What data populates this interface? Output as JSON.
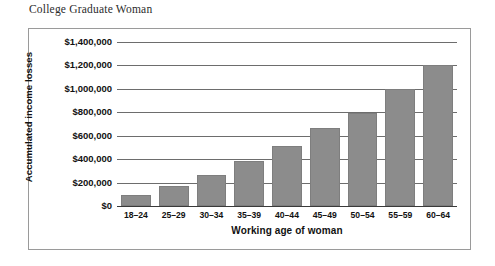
{
  "figure": {
    "caption": "College Graduate Woman"
  },
  "chart_data": {
    "type": "bar",
    "title": "College Graduate Woman",
    "xlabel": "Working age of woman",
    "ylabel": "Accumulated income losses",
    "categories": [
      "18–24",
      "25–29",
      "30–34",
      "35–39",
      "40–44",
      "45–49",
      "50–54",
      "55–59",
      "60–64"
    ],
    "values": [
      90000,
      170000,
      265000,
      385000,
      510000,
      670000,
      790000,
      1000000,
      1200000
    ],
    "ylim": [
      0,
      1400000
    ],
    "ytick_values": [
      0,
      200000,
      400000,
      600000,
      800000,
      1000000,
      1200000,
      1400000
    ],
    "ytick_labels": [
      "$0",
      "$200,000",
      "$400,000",
      "$600,000",
      "$800,000",
      "$1,000,000",
      "$1,200,000",
      "$1,400,000"
    ],
    "grid": true,
    "legend": "none",
    "bar_color": "#8c8c8c",
    "axis_color": "#6d6d6d",
    "frame_color": "#9a9a9a"
  }
}
